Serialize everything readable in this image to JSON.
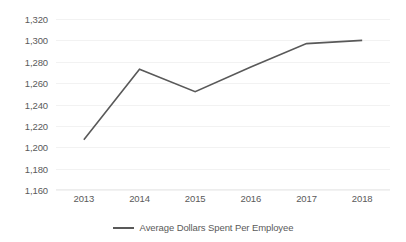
{
  "chart_data": {
    "type": "line",
    "title": "",
    "subtitle": "",
    "xlabel": "",
    "ylabel": "",
    "categories": [
      "2013",
      "2014",
      "2015",
      "2016",
      "2017",
      "2018"
    ],
    "series": [
      {
        "name": "Average Dollars Spent Per Employee",
        "color": "#595959",
        "values": [
          1207,
          1273,
          1252,
          1275,
          1297,
          1300
        ]
      }
    ],
    "ylim": [
      1160,
      1320
    ],
    "y_ticks": [
      1320,
      1300,
      1280,
      1260,
      1240,
      1220,
      1200,
      1180,
      1160
    ],
    "y_tick_labels": [
      "1,320",
      "1,300",
      "1,280",
      "1,260",
      "1,240",
      "1,220",
      "1,200",
      "1,180",
      "1,160"
    ],
    "x_tick_labels": [
      "2013",
      "2014",
      "2015",
      "2016",
      "2017",
      "2018"
    ],
    "grid": {
      "horizontal": true,
      "vertical": false,
      "color": "#f2f2f2"
    },
    "legend": {
      "position": "bottom",
      "entries": [
        {
          "label": "Average Dollars Spent Per Employee",
          "color": "#595959",
          "marker": "line-swatch"
        }
      ]
    },
    "markers": false,
    "axis_color": "#ededed",
    "text_color": "#5a5a5a",
    "background": "#ffffff"
  }
}
